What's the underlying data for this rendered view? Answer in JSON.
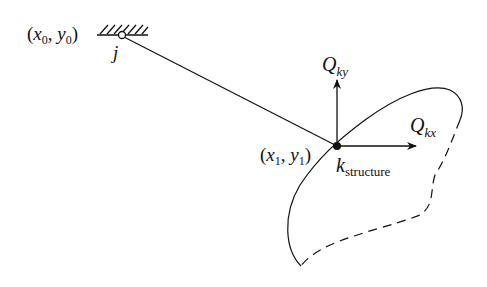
{
  "diagram": {
    "support_point": {
      "label_open": "(",
      "x_var": "x",
      "x_sub": "0",
      "sep": ", ",
      "y_var": "y",
      "y_sub": "0",
      "label_close": ")",
      "node_label": "j"
    },
    "structure_point": {
      "label_open": "(",
      "x_var": "x",
      "x_sub": "1",
      "sep": ", ",
      "y_var": "y",
      "y_sub": "1",
      "label_close": ")",
      "node_label": "k",
      "node_sub": "structure"
    },
    "forces": {
      "vertical": {
        "symbol": "Q",
        "sub": "ky"
      },
      "horizontal": {
        "symbol": "Q",
        "sub": "kx"
      }
    },
    "colors": {
      "line": "#111111",
      "background": "#ffffff"
    }
  }
}
